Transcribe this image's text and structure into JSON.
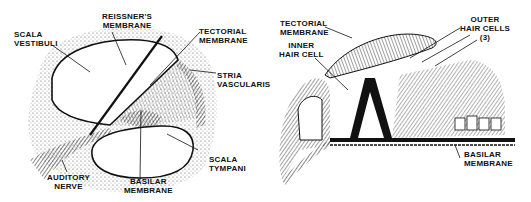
{
  "left_panel": {
    "labels": {
      "scala_vestibuli": "SCALA\nVESTIBULI",
      "reissners_membrane": "REISSNER'S\nMEMBRANE",
      "tectorial_membrane": "TECTORIAL\nMEMBRANE",
      "stria_vascularis": "STRIA\nVASCULARIS",
      "scala_tympani": "SCALA\nTYMPANI",
      "basilar_membrane": "BASILAR\nMEMBRANE",
      "auditory_nerve": "AUDITORY\nNERVE"
    }
  },
  "right_panel": {
    "labels": {
      "tectorial_membrane": "TECTORIAL\nMEMBRANE",
      "inner_hair_cell": "INNER\nHAIR CELL",
      "outer_hair_cells": "OUTER\nHAIR CELLS\n(3)",
      "basilar_membrane": "BASILAR\nMEMBRANE"
    }
  }
}
